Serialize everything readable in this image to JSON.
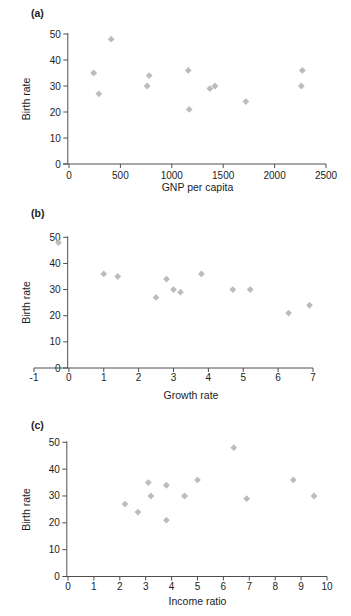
{
  "figure": {
    "background": "#ffffff",
    "marker_color": "#bcbcbc",
    "axis_color": "#4f4f4f",
    "text_color": "#1f1f1f",
    "marker_shape": "diamond"
  },
  "chart_data": [
    {
      "type": "scatter",
      "panel_label": "(a)",
      "xlabel": "GNP per capita",
      "ylabel": "Birth rate",
      "xlim": [
        0,
        2500
      ],
      "ylim": [
        0,
        50
      ],
      "x_ticks": [
        0,
        500,
        1000,
        1500,
        2000,
        2500
      ],
      "y_ticks": [
        0,
        10,
        20,
        30,
        40,
        50
      ],
      "grid": false,
      "legend": false,
      "points": [
        [
          240,
          35
        ],
        [
          290,
          27
        ],
        [
          410,
          48
        ],
        [
          760,
          30
        ],
        [
          780,
          34
        ],
        [
          1160,
          36
        ],
        [
          1170,
          21
        ],
        [
          1370,
          29
        ],
        [
          1420,
          30
        ],
        [
          1720,
          24
        ],
        [
          2260,
          30
        ],
        [
          2270,
          36
        ]
      ]
    },
    {
      "type": "scatter",
      "panel_label": "(b)",
      "xlabel": "Growth rate",
      "ylabel": "Birth rate",
      "xlim": [
        -1,
        7
      ],
      "ylim": [
        0,
        50
      ],
      "x_ticks": [
        -1,
        0,
        1,
        2,
        3,
        4,
        5,
        6,
        7
      ],
      "y_ticks": [
        0,
        10,
        20,
        30,
        40,
        50
      ],
      "grid": false,
      "legend": false,
      "points": [
        [
          -0.3,
          48
        ],
        [
          1.0,
          36
        ],
        [
          1.4,
          35
        ],
        [
          2.5,
          27
        ],
        [
          2.8,
          34
        ],
        [
          3.0,
          30
        ],
        [
          3.2,
          29
        ],
        [
          3.8,
          36
        ],
        [
          4.7,
          30
        ],
        [
          5.2,
          30
        ],
        [
          6.3,
          21
        ],
        [
          6.9,
          24
        ]
      ]
    },
    {
      "type": "scatter",
      "panel_label": "(c)",
      "xlabel": "Income ratio",
      "ylabel": "Birth rate",
      "xlim": [
        0,
        10
      ],
      "ylim": [
        0,
        50
      ],
      "x_ticks": [
        0,
        1,
        2,
        3,
        4,
        5,
        6,
        7,
        8,
        9,
        10
      ],
      "y_ticks": [
        0,
        10,
        20,
        30,
        40,
        50
      ],
      "grid": false,
      "legend": false,
      "points": [
        [
          2.2,
          27
        ],
        [
          2.7,
          24
        ],
        [
          3.1,
          35
        ],
        [
          3.2,
          30
        ],
        [
          3.8,
          34
        ],
        [
          3.8,
          21
        ],
        [
          4.5,
          30
        ],
        [
          5.0,
          36
        ],
        [
          6.4,
          48
        ],
        [
          6.9,
          29
        ],
        [
          8.7,
          36
        ],
        [
          9.5,
          30
        ]
      ]
    }
  ]
}
